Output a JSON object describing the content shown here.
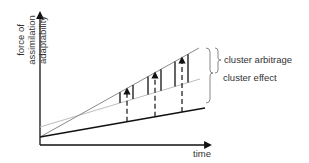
{
  "diagram": {
    "y_axis_label_line1": "force of assimilation",
    "y_axis_label_line2": "adaptability",
    "x_axis_label": "time",
    "annotations": {
      "upper_brace": "cluster arbitrage",
      "lower_brace": "cluster effect"
    },
    "lines": [
      {
        "name": "steep-gray-line",
        "color": "#8a8a8a",
        "from": [
          40,
          137
        ],
        "to": [
          199,
          48
        ]
      },
      {
        "name": "light-gray-line",
        "color": "#bdbdbd",
        "from": [
          40,
          127
        ],
        "to": [
          200,
          79
        ]
      },
      {
        "name": "baseline-black-line",
        "color": "#111111",
        "from": [
          40,
          137
        ],
        "to": [
          205,
          108
        ]
      }
    ],
    "solid_verticals_x": [
      120,
      133,
      148,
      161,
      175,
      188
    ],
    "dashed_arrows_x": [
      127,
      155,
      182
    ],
    "colors": {
      "axis": "#111111",
      "text": "#333333"
    }
  }
}
